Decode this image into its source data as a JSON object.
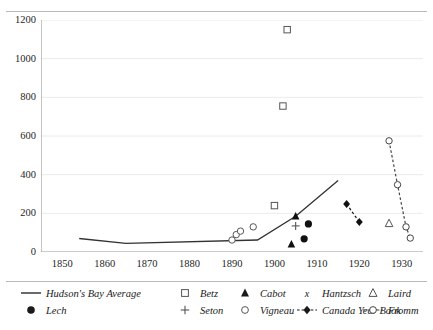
{
  "chart_data": {
    "type": "scatter",
    "title": "",
    "subtitle": "",
    "xlabel": "",
    "ylabel": "",
    "xlim": [
      1845,
      1935
    ],
    "ylim": [
      0,
      1200
    ],
    "xticks": [
      1850,
      1860,
      1870,
      1880,
      1890,
      1900,
      1910,
      1920,
      1930
    ],
    "yticks": [
      0,
      200,
      400,
      600,
      800,
      1000,
      1200
    ],
    "grid": "horizontal",
    "legend_position": "bottom",
    "series": [
      {
        "name": "Hudson's Bay Average",
        "marker": "line",
        "style": "solid-line",
        "color": "#333333",
        "points": [
          {
            "x": 1854,
            "y": 70
          },
          {
            "x": 1865,
            "y": 45
          },
          {
            "x": 1896,
            "y": 62
          },
          {
            "x": 1905,
            "y": 185
          },
          {
            "x": 1915,
            "y": 370
          }
        ]
      },
      {
        "name": "Betz",
        "marker": "open-square",
        "style": "markers",
        "color": "#555555",
        "points": [
          {
            "x": 1900,
            "y": 240
          },
          {
            "x": 1902,
            "y": 755
          },
          {
            "x": 1903,
            "y": 1150
          }
        ]
      },
      {
        "name": "Cabot",
        "marker": "filled-triangle",
        "style": "markers",
        "color": "#111111",
        "points": [
          {
            "x": 1904,
            "y": 40
          },
          {
            "x": 1905,
            "y": 185
          }
        ]
      },
      {
        "name": "Hantzsch",
        "marker": "x",
        "style": "markers",
        "color": "#111111",
        "points": [
          {
            "x": 1931,
            "y": 130
          },
          {
            "x": 1932,
            "y": 72
          }
        ]
      },
      {
        "name": "Laird",
        "marker": "open-triangle",
        "style": "markers",
        "color": "#555555",
        "points": [
          {
            "x": 1927,
            "y": 148
          }
        ]
      },
      {
        "name": "Lech",
        "marker": "filled-circle",
        "style": "markers",
        "color": "#111111",
        "points": [
          {
            "x": 1907,
            "y": 68
          },
          {
            "x": 1908,
            "y": 145
          }
        ]
      },
      {
        "name": "Seton",
        "marker": "plus",
        "style": "markers",
        "color": "#555555",
        "points": [
          {
            "x": 1905,
            "y": 135
          }
        ]
      },
      {
        "name": "Vigneau",
        "marker": "open-circle",
        "style": "markers",
        "color": "#555555",
        "points": [
          {
            "x": 1890,
            "y": 62
          },
          {
            "x": 1891,
            "y": 90
          },
          {
            "x": 1892,
            "y": 108
          },
          {
            "x": 1895,
            "y": 130
          }
        ]
      },
      {
        "name": "Canada Year Book",
        "marker": "filled-diamond",
        "style": "dashed-line",
        "color": "#111111",
        "points": [
          {
            "x": 1917,
            "y": 248
          },
          {
            "x": 1920,
            "y": 155
          }
        ]
      },
      {
        "name": "Fromm",
        "marker": "open-circle",
        "style": "dashed-line",
        "color": "#444444",
        "points": [
          {
            "x": 1927,
            "y": 575
          },
          {
            "x": 1929,
            "y": 348
          },
          {
            "x": 1931,
            "y": 130
          },
          {
            "x": 1932,
            "y": 72
          }
        ]
      }
    ]
  },
  "legend": {
    "row1": [
      {
        "label": "Hudson's Bay Average",
        "key": "solid-line-key"
      },
      {
        "label": "Betz",
        "key": "open-square-key"
      },
      {
        "label": "Cabot",
        "key": "filled-triangle-key"
      },
      {
        "label": "Hantzsch",
        "key": "x-key"
      },
      {
        "label": "Laird",
        "key": "open-triangle-key"
      }
    ],
    "row2": [
      {
        "label": "Lech",
        "key": "filled-circle-key"
      },
      {
        "label": "Seton",
        "key": "plus-key"
      },
      {
        "label": "Vigneau",
        "key": "open-circle-key"
      },
      {
        "label": "Canada Year Book",
        "key": "dashed-diamond-key"
      },
      {
        "label": "Fromm",
        "key": "dashed-open-circle-key"
      }
    ]
  },
  "colors": {
    "axis": "#8c8c8c",
    "grid": "#e4e4e4",
    "rule": "#b9b9b9",
    "text": "#262626"
  }
}
